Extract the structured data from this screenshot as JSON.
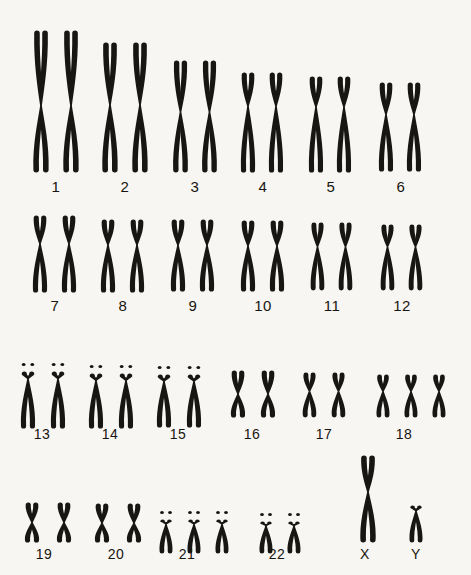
{
  "figure": {
    "background_color": "#f7f6f3",
    "ink_color": "#181613",
    "width": 471,
    "height": 575,
    "total_chromosomes": 48,
    "sex_chromosomes": "XY"
  },
  "rows": [
    {
      "name": "row-A-B",
      "label_y": 178,
      "groups": [
        {
          "id": "pair-1",
          "label": "1",
          "count": 2,
          "shape": "metacentric-long",
          "x": 28,
          "y": 30,
          "label_x": 28,
          "label_w": 56,
          "chrom_w": 26,
          "chrom_h": 143,
          "arm_ratio": 0.53,
          "gap": 4,
          "satellites": false
        },
        {
          "id": "pair-2",
          "label": "2",
          "count": 2,
          "shape": "submetacentric-long",
          "x": 97,
          "y": 42,
          "label_x": 97,
          "label_w": 56,
          "chrom_w": 26,
          "chrom_h": 131,
          "arm_ratio": 0.48,
          "gap": 4,
          "satellites": false
        },
        {
          "id": "pair-3",
          "label": "3",
          "count": 2,
          "shape": "metacentric",
          "x": 168,
          "y": 60,
          "label_x": 168,
          "label_w": 54,
          "chrom_w": 25,
          "chrom_h": 113,
          "arm_ratio": 0.46,
          "gap": 4,
          "satellites": false
        },
        {
          "id": "pair-4",
          "label": "4",
          "count": 2,
          "shape": "submetacentric",
          "x": 236,
          "y": 72,
          "label_x": 236,
          "label_w": 54,
          "chrom_w": 24,
          "chrom_h": 101,
          "arm_ratio": 0.34,
          "gap": 4,
          "satellites": false
        },
        {
          "id": "pair-5",
          "label": "5",
          "count": 2,
          "shape": "submetacentric",
          "x": 304,
          "y": 76,
          "label_x": 304,
          "label_w": 54,
          "chrom_w": 24,
          "chrom_h": 97,
          "arm_ratio": 0.32,
          "gap": 4,
          "satellites": false
        },
        {
          "id": "pair-6",
          "label": "6",
          "count": 2,
          "shape": "submetacentric",
          "x": 374,
          "y": 82,
          "label_x": 374,
          "label_w": 54,
          "chrom_w": 24,
          "chrom_h": 90,
          "arm_ratio": 0.36,
          "gap": 4,
          "satellites": false
        }
      ]
    },
    {
      "name": "row-C",
      "label_y": 297,
      "groups": [
        {
          "id": "pair-7",
          "label": "7",
          "count": 2,
          "shape": "submetacentric",
          "x": 28,
          "y": 215,
          "label_x": 28,
          "label_w": 54,
          "chrom_w": 24,
          "chrom_h": 78,
          "arm_ratio": 0.37,
          "gap": 5,
          "satellites": false
        },
        {
          "id": "pair-8",
          "label": "8",
          "count": 2,
          "shape": "submetacentric",
          "x": 96,
          "y": 219,
          "label_x": 96,
          "label_w": 54,
          "chrom_w": 24,
          "chrom_h": 74,
          "arm_ratio": 0.35,
          "gap": 5,
          "satellites": false
        },
        {
          "id": "pair-9",
          "label": "9",
          "count": 2,
          "shape": "submetacentric",
          "x": 166,
          "y": 219,
          "label_x": 166,
          "label_w": 54,
          "chrom_w": 24,
          "chrom_h": 73,
          "arm_ratio": 0.36,
          "gap": 5,
          "satellites": false
        },
        {
          "id": "pair-10",
          "label": "10",
          "count": 2,
          "shape": "submetacentric",
          "x": 236,
          "y": 220,
          "label_x": 234,
          "label_w": 58,
          "chrom_w": 24,
          "chrom_h": 72,
          "arm_ratio": 0.36,
          "gap": 5,
          "satellites": false
        },
        {
          "id": "pair-11",
          "label": "11",
          "count": 2,
          "shape": "submetacentric",
          "x": 306,
          "y": 222,
          "label_x": 304,
          "label_w": 56,
          "chrom_w": 23,
          "chrom_h": 69,
          "arm_ratio": 0.36,
          "gap": 5,
          "satellites": false
        },
        {
          "id": "pair-12",
          "label": "12",
          "count": 2,
          "shape": "submetacentric",
          "x": 376,
          "y": 224,
          "label_x": 374,
          "label_w": 56,
          "chrom_w": 23,
          "chrom_h": 67,
          "arm_ratio": 0.34,
          "gap": 5,
          "satellites": false
        }
      ]
    },
    {
      "name": "row-D-E",
      "label_y": 426,
      "groups": [
        {
          "id": "pair-13",
          "label": "13",
          "count": 2,
          "shape": "acrocentric",
          "x": 16,
          "y": 360,
          "label_x": 12,
          "label_w": 60,
          "chrom_w": 24,
          "chrom_h": 58,
          "arm_ratio": 0.14,
          "gap": 6,
          "satellites": true
        },
        {
          "id": "pair-14",
          "label": "14",
          "count": 2,
          "shape": "acrocentric",
          "x": 84,
          "y": 362,
          "label_x": 80,
          "label_w": 60,
          "chrom_w": 24,
          "chrom_h": 56,
          "arm_ratio": 0.14,
          "gap": 6,
          "satellites": true
        },
        {
          "id": "pair-15",
          "label": "15",
          "count": 2,
          "shape": "acrocentric",
          "x": 152,
          "y": 363,
          "label_x": 148,
          "label_w": 60,
          "chrom_w": 24,
          "chrom_h": 54,
          "arm_ratio": 0.14,
          "gap": 6,
          "satellites": true
        },
        {
          "id": "pair-16",
          "label": "16",
          "count": 2,
          "shape": "metacentric",
          "x": 226,
          "y": 370,
          "label_x": 222,
          "label_w": 60,
          "chrom_w": 24,
          "chrom_h": 48,
          "arm_ratio": 0.5,
          "gap": 6,
          "satellites": false
        },
        {
          "id": "pair-17",
          "label": "17",
          "count": 2,
          "shape": "submetacentric",
          "x": 298,
          "y": 372,
          "label_x": 294,
          "label_w": 60,
          "chrom_w": 23,
          "chrom_h": 46,
          "arm_ratio": 0.42,
          "gap": 6,
          "satellites": false
        },
        {
          "id": "trisomy-18",
          "label": "18",
          "count": 3,
          "shape": "submetacentric",
          "x": 372,
          "y": 374,
          "label_x": 374,
          "label_w": 60,
          "chrom_w": 22,
          "chrom_h": 44,
          "arm_ratio": 0.4,
          "gap": 6,
          "satellites": false
        }
      ]
    },
    {
      "name": "row-F-G-sex",
      "label_y": 546,
      "groups": [
        {
          "id": "pair-19",
          "label": "19",
          "count": 2,
          "shape": "metacentric",
          "x": 20,
          "y": 502,
          "label_x": 14,
          "label_w": 60,
          "chrom_w": 24,
          "chrom_h": 41,
          "arm_ratio": 0.5,
          "gap": 8,
          "satellites": false
        },
        {
          "id": "pair-20",
          "label": "20",
          "count": 2,
          "shape": "metacentric",
          "x": 90,
          "y": 503,
          "label_x": 86,
          "label_w": 60,
          "chrom_w": 24,
          "chrom_h": 40,
          "arm_ratio": 0.5,
          "gap": 8,
          "satellites": false
        },
        {
          "id": "trisomy-21",
          "label": "21",
          "count": 3,
          "shape": "acrocentric",
          "x": 155,
          "y": 508,
          "label_x": 157,
          "label_w": 60,
          "chrom_w": 22,
          "chrom_h": 35,
          "arm_ratio": 0.15,
          "gap": 6,
          "satellites": true
        },
        {
          "id": "pair-22",
          "label": "22",
          "count": 2,
          "shape": "acrocentric",
          "x": 255,
          "y": 510,
          "label_x": 247,
          "label_w": 60,
          "chrom_w": 22,
          "chrom_h": 33,
          "arm_ratio": 0.15,
          "gap": 6,
          "satellites": true
        },
        {
          "id": "chrom-X",
          "label": "X",
          "count": 1,
          "shape": "submetacentric-long",
          "x": 355,
          "y": 455,
          "label_x": 345,
          "label_w": 40,
          "chrom_w": 26,
          "chrom_h": 88,
          "arm_ratio": 0.42,
          "gap": 6,
          "satellites": false
        },
        {
          "id": "chrom-Y",
          "label": "Y",
          "count": 1,
          "shape": "acrocentric",
          "x": 405,
          "y": 505,
          "label_x": 396,
          "label_w": 40,
          "chrom_w": 22,
          "chrom_h": 38,
          "arm_ratio": 0.16,
          "gap": 6,
          "satellites": false
        }
      ]
    }
  ]
}
